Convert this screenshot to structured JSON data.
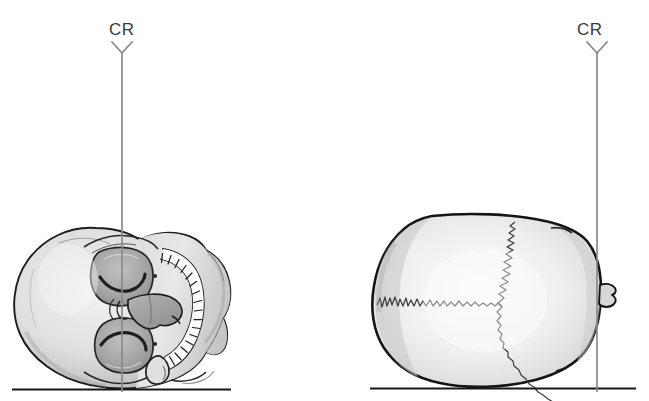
{
  "figure": {
    "kind": "medical-illustration",
    "background_color": "#ffffff",
    "line_color": "#1a1a1a",
    "cr_line_color": "#8a8a8a",
    "bone_light": "#ececec",
    "bone_mid": "#cfcfcf",
    "bone_shadow": "#9a9a9a",
    "suture_color": "#4a4a4a"
  },
  "panels": [
    {
      "id": "left",
      "name": "submentovertex-skull-view",
      "cr": {
        "label": "CR",
        "label_x": 109,
        "label_y": 20,
        "arrow_x": 122,
        "arrow_top_y": 42,
        "line_top_y": 52,
        "line_bottom_y": 392
      },
      "baseline": {
        "x1": 12,
        "x2": 231,
        "y": 389
      },
      "skull": {
        "bounds": {
          "x": 8,
          "y": 226,
          "w": 220,
          "h": 163
        },
        "features": [
          "cranial-vault",
          "orbit-upper",
          "orbit-lower",
          "nasal-septum",
          "palate",
          "maxillary-dental-arch",
          "mandible-condyle",
          "zygomatic-arch"
        ],
        "tooth_count": 14
      }
    },
    {
      "id": "right",
      "name": "vertex-skull-view",
      "cr": {
        "label": "CR",
        "label_x": 577,
        "label_y": 20,
        "arrow_x": 597,
        "arrow_top_y": 42,
        "line_top_y": 52,
        "line_bottom_y": 392
      },
      "baseline": {
        "x1": 370,
        "x2": 636,
        "y": 388
      },
      "skull": {
        "bounds": {
          "x": 373,
          "y": 214,
          "w": 232,
          "h": 175
        },
        "features": [
          "cranial-vault-superior",
          "sagittal-suture",
          "coronal-suture",
          "nasal-bone-prominence"
        ]
      }
    }
  ],
  "annotations": {
    "cr_meaning": "CR",
    "arrow_glyph": "chevron-down"
  }
}
